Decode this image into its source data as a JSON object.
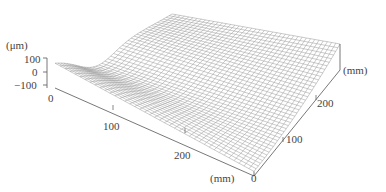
{
  "chart_data": {
    "type": "surface3d",
    "title": "",
    "z_unit_label": "(μm)",
    "x_unit_label": "(mm)",
    "y_unit_label": "(mm)",
    "z_ticks": [
      "100",
      "0",
      "−100"
    ],
    "x_ticks": [
      "0",
      "100",
      "200"
    ],
    "y_ticks": [
      "0",
      "100",
      "200"
    ],
    "z_range": [
      -100,
      100
    ],
    "x_range": [
      0,
      300
    ],
    "y_range": [
      0,
      300
    ],
    "grid": true
  },
  "colors": {
    "mesh": "#8a8a8a",
    "axis": "#555555",
    "text": "#444444"
  }
}
